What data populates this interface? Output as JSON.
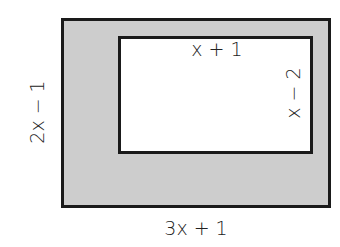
{
  "diagram": {
    "type": "nested-rectangles",
    "outer_rectangle": {
      "width_label": "3x + 1",
      "height_label": "2x − 1",
      "fill": "#cdcdcd",
      "stroke": "#1a1a1a"
    },
    "inner_rectangle": {
      "width_label": "x + 1",
      "height_label": "x − 2",
      "fill": "#ffffff",
      "stroke": "#1a1a1a"
    }
  }
}
